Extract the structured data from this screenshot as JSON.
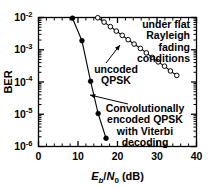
{
  "chart_data": {
    "type": "line",
    "title": "",
    "xlabel": "E_b/N_0 (dB)",
    "xlabel_parts": {
      "e": "E",
      "sub_b": "b",
      "slash": "/",
      "n": "N",
      "sub_0": "0",
      "unit": "(dB)"
    },
    "ylabel": "BER",
    "xlim": [
      0,
      40
    ],
    "ylim": [
      1e-06,
      0.01
    ],
    "yscale": "log",
    "xscale": "linear",
    "xticks": [
      0,
      10,
      20,
      30,
      40
    ],
    "xticklabels": [
      "0",
      "10",
      "20",
      "30",
      "40"
    ],
    "yticks": [
      0.01,
      0.001,
      0.0001,
      1e-05,
      1e-06
    ],
    "yticklabels": [
      "10-2",
      "10-3",
      "10-4",
      "10-5",
      "10-6"
    ],
    "ytick_mantissa": "10",
    "ytick_exponents": [
      "-2",
      "-3",
      "-4",
      "-5",
      "-6"
    ],
    "grid": false,
    "legend": "none",
    "minor_ticks": true,
    "series": [
      {
        "name": "Convolutionally encoded QPSK with Viterbi decoding",
        "marker": "filled-circle",
        "color": "#000000",
        "x": [
          8.6,
          11.0,
          13.2,
          15.1,
          17.1
        ],
        "y": [
          0.0095,
          0.0019,
          0.000105,
          1.05e-05,
          1.8e-06
        ]
      },
      {
        "name": "uncoded QPSK",
        "marker": "open-circle",
        "color": "#000000",
        "x": [
          15.0,
          16.6,
          18.2,
          19.7,
          21.2,
          22.7,
          24.2,
          25.8,
          27.3,
          28.8,
          30.3,
          31.9,
          33.4,
          35.0
        ],
        "y": [
          0.0098,
          0.0072,
          0.0052,
          0.0038,
          0.0028,
          0.00205,
          0.0015,
          0.0011,
          0.0008,
          0.00058,
          0.00042,
          0.00031,
          0.00022,
          0.00016
        ]
      }
    ],
    "annotations": [
      {
        "id": "under-flat-rayleigh",
        "lines": [
          "under flat",
          "Rayleigh",
          "fading",
          "conditions"
        ],
        "arrow": false
      },
      {
        "id": "uncoded-qpsk",
        "lines": [
          "uncoded",
          "QPSK"
        ],
        "arrow": true
      },
      {
        "id": "conv-encoded-qpsk",
        "lines": [
          "Convolutionally",
          "encoded QPSK",
          "with Viterbi",
          "decoding"
        ],
        "arrow": true
      }
    ]
  }
}
